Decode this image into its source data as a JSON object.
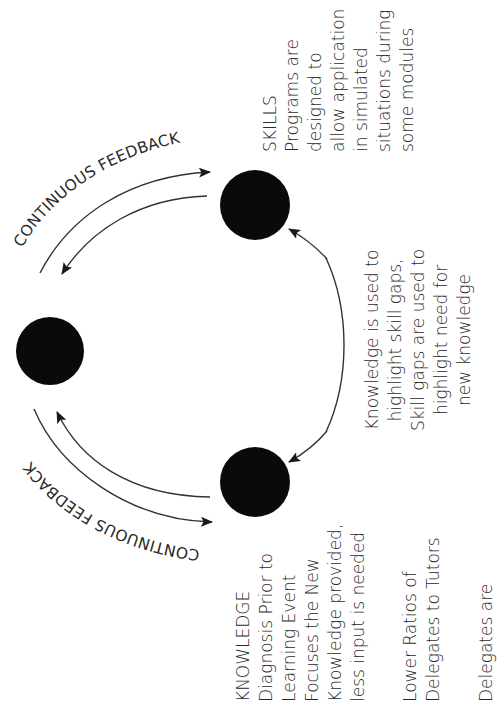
{
  "diagram": {
    "orientation": "rotated -90deg (text reads bottom-to-top)",
    "nodes": [
      {
        "id": "skills",
        "label": "SKILLS",
        "cx": 255,
        "cy": 205,
        "r": 35
      },
      {
        "id": "center-left",
        "label": "",
        "cx": 50,
        "cy": 351,
        "r": 34
      },
      {
        "id": "knowledge",
        "label": "KNOWLEDGE",
        "cx": 255,
        "cy": 482,
        "r": 35
      }
    ],
    "feedback_top": {
      "label": "CONTINUOUS FEEDBACK"
    },
    "feedback_bottom": {
      "label": "CONTINUOUS FEEDBACK"
    },
    "skills_block": {
      "lines": [
        "SKILLS",
        "Programs are",
        "designed to",
        "allow application",
        "in simulated",
        "situations during",
        "some modules"
      ]
    },
    "link_block": {
      "lines": [
        "Knowledge is used to",
        "highlight skill gaps,",
        "Skill gaps are used to",
        "highlight need for",
        "new knowledge"
      ]
    },
    "knowledge_block": {
      "lines": [
        "KNOWLEDGE",
        "Diagnosis Prior to",
        "Learning Event",
        "Focuses the New",
        "Knowledge provided,",
        "less input is needed",
        "",
        "Lower Ratios of",
        "Delegates to Tutors",
        "",
        "Delegates are"
      ]
    },
    "colors": {
      "node": "#0a0a0a",
      "line": "#333333",
      "text": "#2a2a2a",
      "background": "#ffffff"
    }
  }
}
